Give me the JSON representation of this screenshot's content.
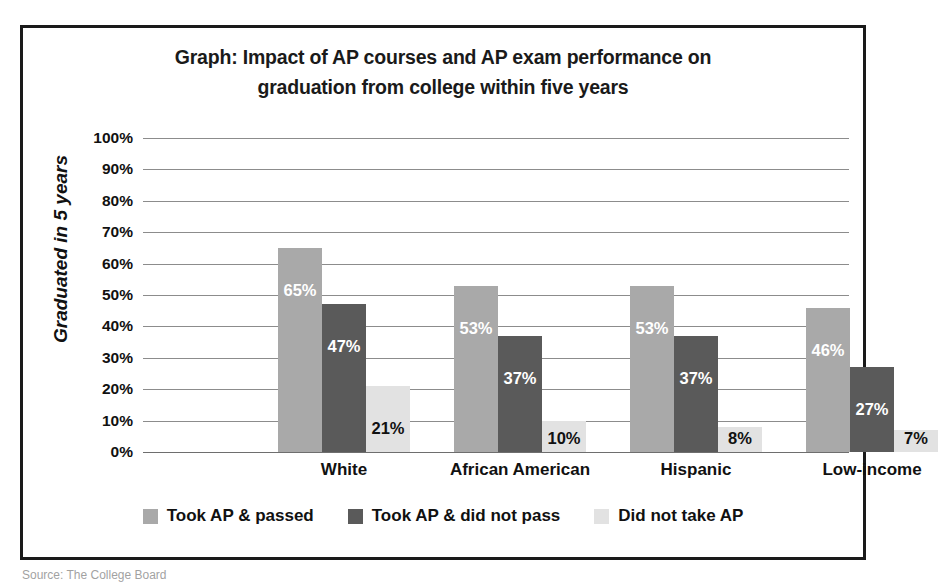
{
  "figure": {
    "title_line1": "Graph: Impact of AP courses and AP exam performance on",
    "title_line2": "graduation from college within five years",
    "source_caption": "Source: The College Board"
  },
  "chart_data": {
    "type": "bar",
    "title": "Graph: Impact of AP courses and AP exam performance on graduation from college within five years",
    "xlabel": "",
    "ylabel": "Graduated in 5 years",
    "categories": [
      "White",
      "African American",
      "Hispanic",
      "Low-income"
    ],
    "series": [
      {
        "name": "Took AP & passed",
        "color": "#a9a9a9",
        "label_color": "#ffffff",
        "values": [
          65,
          47,
          53,
          53
        ],
        "bar_values": [
          65,
          53,
          53,
          46
        ],
        "value_labels": [
          "65%",
          "53%",
          "53%",
          "46%"
        ]
      },
      {
        "name": "Took AP & did not pass",
        "color": "#5a5a5a",
        "label_color": "#ffffff",
        "bar_values": [
          47,
          37,
          37,
          27
        ],
        "value_labels": [
          "47%",
          "37%",
          "37%",
          "27%"
        ]
      },
      {
        "name": "Did not take AP",
        "color": "#e2e2e2",
        "label_color": "#111111",
        "bar_values": [
          21,
          10,
          8,
          7
        ],
        "value_labels": [
          "21%",
          "10%",
          "8%",
          "7%"
        ]
      }
    ],
    "ylim": [
      0,
      100
    ],
    "ytick_values": [
      100,
      90,
      80,
      70,
      60,
      50,
      40,
      30,
      20,
      10,
      0
    ],
    "ytick_labels": [
      "100%",
      "90%",
      "80%",
      "70%",
      "60%",
      "50%",
      "40%",
      "30%",
      "20%",
      "10%",
      "0%"
    ],
    "grid": true,
    "legend_position": "bottom",
    "bar_width_px": 44,
    "group_centers_px": [
      201,
      377,
      553,
      729
    ]
  }
}
